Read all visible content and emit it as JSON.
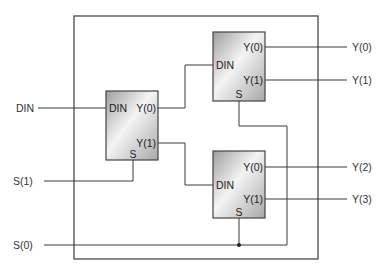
{
  "diagram": {
    "type": "demultiplexer-tree",
    "inputs": {
      "din": "DIN",
      "s1": "S(1)",
      "s0": "S(0)"
    },
    "outputs": [
      "Y(0)",
      "Y(1)",
      "Y(2)",
      "Y(3)"
    ],
    "blocks": [
      {
        "id": "demux-left",
        "pins": {
          "din": "DIN",
          "y0": "Y(0)",
          "y1": "Y(1)",
          "s": "S"
        }
      },
      {
        "id": "demux-top-right",
        "pins": {
          "din": "DIN",
          "y0": "Y(0)",
          "y1": "Y(1)",
          "s": "S"
        }
      },
      {
        "id": "demux-bottom-right",
        "pins": {
          "din": "DIN",
          "y0": "Y(0)",
          "y1": "Y(1)",
          "s": "S"
        }
      }
    ],
    "colors": {
      "wire": "#3a3a3a",
      "block_border": "#444444",
      "block_fill_light": "#f2f2f2",
      "block_fill_dark": "#a9a9a9"
    }
  }
}
